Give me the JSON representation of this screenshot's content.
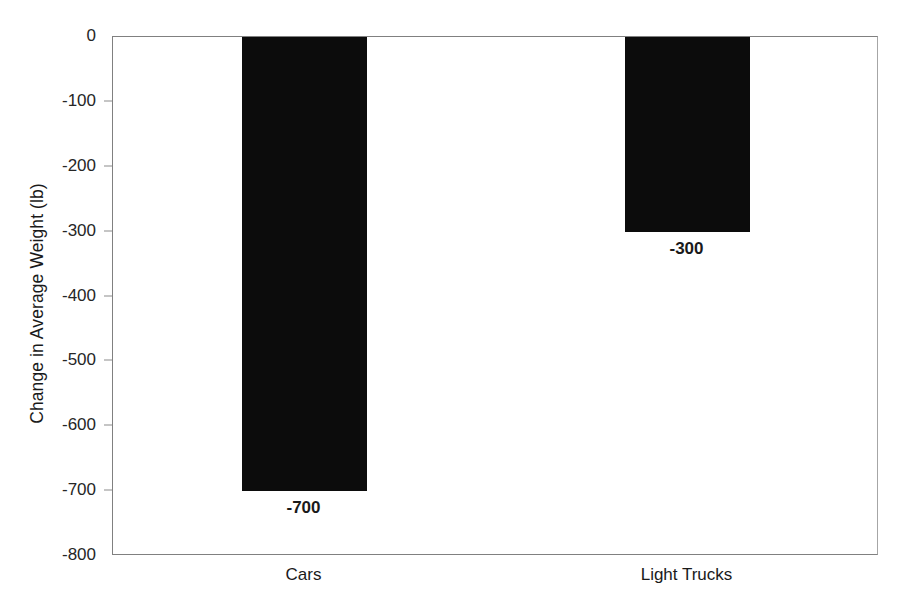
{
  "chart_data": {
    "type": "bar",
    "title": "",
    "subtitle": "",
    "xlabel": "",
    "ylabel": "Change in Average Weight (lb)",
    "categories": [
      "Cars",
      "Light Trucks"
    ],
    "values": [
      -700,
      -300
    ],
    "data_labels": [
      "-700",
      "-300"
    ],
    "ylim": [
      -800,
      0
    ],
    "y_ticks": [
      0,
      -100,
      -200,
      -300,
      -400,
      -500,
      -600,
      -700,
      -800
    ],
    "y_tick_labels": [
      "0",
      "-100",
      "-200",
      "-300",
      "-400",
      "-500",
      "-600",
      "-700",
      "-800"
    ],
    "grid": false,
    "legend": false,
    "legend_position": "none",
    "series": [
      {
        "name": "Change in Average Weight",
        "values": [
          -700,
          -300
        ],
        "color": "#0c0c0c"
      }
    ],
    "colors": {
      "bar": "#0c0c0c",
      "axis": "#808080",
      "text": "#1a1a1a",
      "background": "#ffffff"
    }
  }
}
